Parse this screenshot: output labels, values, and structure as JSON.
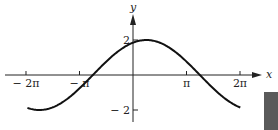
{
  "chart_data": {
    "type": "line",
    "title": "",
    "xlabel": "x",
    "ylabel": "y",
    "function": "y = 2 sin((x + 3π/4) / 2)",
    "x_ticks": [
      {
        "value": -6.2832,
        "label": "− 2π"
      },
      {
        "value": -3.1416,
        "label": "− π"
      },
      {
        "value": 3.1416,
        "label": "π"
      },
      {
        "value": 6.2832,
        "label": "2π"
      }
    ],
    "y_ticks": [
      {
        "value": 2,
        "label": "2"
      },
      {
        "value": -2,
        "label": "− 2"
      }
    ],
    "xlim": [
      -7.0,
      7.5
    ],
    "ylim": [
      -2.6,
      3.2
    ],
    "x_domain": [
      -6.2,
      6.3
    ],
    "grid": false,
    "legend": null,
    "series": [
      {
        "name": "curve",
        "x": [
          -6.2,
          -5.5,
          -4.71,
          -3.93,
          -3.14,
          -2.36,
          -1.57,
          -0.79,
          0,
          0.79,
          1.57,
          2.36,
          3.14,
          3.93,
          4.71,
          5.5,
          6.3
        ],
        "y": [
          -1.86,
          -1.99,
          -1.85,
          -1.41,
          -0.77,
          0,
          0.77,
          1.41,
          1.85,
          2.0,
          1.85,
          1.41,
          0.77,
          0,
          -0.77,
          -1.41,
          -1.86
        ]
      }
    ]
  },
  "axis_labels": {
    "x": "x",
    "y": "y"
  },
  "decor": {
    "corner_block_color": "#5a5a5a"
  }
}
